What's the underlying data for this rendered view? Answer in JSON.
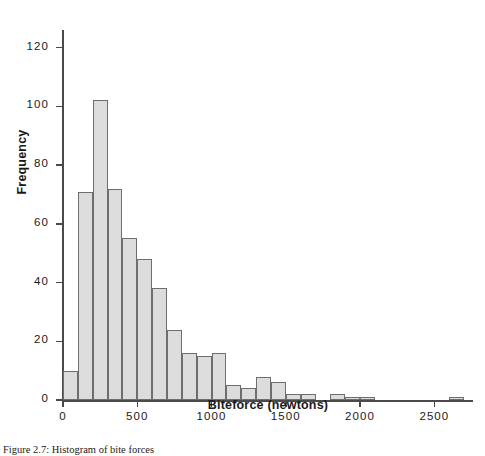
{
  "figure": {
    "caption": "Figure 2.7: Histogram of bite forces"
  },
  "chart_data": {
    "type": "bar",
    "subtype": "histogram",
    "title": "",
    "xlabel": "Biteforce (newtons)",
    "ylabel": "Frequency",
    "xlim": [
      0,
      2760
    ],
    "ylim": [
      0,
      126
    ],
    "bin_width": 100,
    "grid": false,
    "legend": null,
    "xticks": [
      0,
      500,
      1000,
      1500,
      2000,
      2500
    ],
    "xtick_labels": [
      "0",
      "500",
      "1000",
      "1500",
      "2000",
      "2500"
    ],
    "yticks": [
      0,
      20,
      40,
      60,
      80,
      100,
      120
    ],
    "ytick_labels": [
      "0",
      "20",
      "40",
      "60",
      "80",
      "100",
      "120"
    ],
    "bar_fill_color": "#dcdcdc",
    "bar_edge_color": "#6e6e6e",
    "axis_color": "#4a4a4a",
    "categories": [
      "0-100",
      "100-200",
      "200-300",
      "300-400",
      "400-500",
      "500-600",
      "600-700",
      "700-800",
      "800-900",
      "900-1000",
      "1000-1100",
      "1100-1200",
      "1200-1300",
      "1300-1400",
      "1400-1500",
      "1500-1600",
      "1600-1700",
      "1700-1800",
      "1800-1900",
      "1900-2000",
      "2000-2100",
      "2100-2200",
      "2200-2300",
      "2300-2400",
      "2400-2500",
      "2500-2600",
      "2600-2700"
    ],
    "bin_starts": [
      0,
      100,
      200,
      300,
      400,
      500,
      600,
      700,
      800,
      900,
      1000,
      1100,
      1200,
      1300,
      1400,
      1500,
      1600,
      1700,
      1800,
      1900,
      2000,
      2100,
      2200,
      2300,
      2400,
      2500,
      2600
    ],
    "values": [
      10,
      71,
      102,
      72,
      55,
      48,
      38,
      24,
      16,
      15,
      16,
      5,
      4,
      8,
      6,
      2,
      2,
      0,
      2,
      1,
      1,
      0,
      0,
      0,
      0,
      0,
      1
    ]
  }
}
